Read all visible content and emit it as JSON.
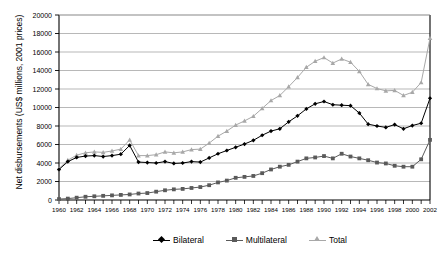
{
  "chart_data": {
    "type": "line",
    "title": "",
    "xlabel": "",
    "ylabel": "Net disbursements (US$ millions, 2001 prices)",
    "ylim": [
      0,
      20000
    ],
    "ytick_step": 2000,
    "yticks": [
      "0",
      "2000",
      "4000",
      "6000",
      "8000",
      "10000",
      "12000",
      "14000",
      "16000",
      "18000",
      "20000"
    ],
    "xlim": [
      1960,
      2002
    ],
    "xtick_step": 2,
    "grid": "horizontal",
    "legend_position": "bottom",
    "x": [
      1960,
      1961,
      1962,
      1963,
      1964,
      1965,
      1966,
      1967,
      1968,
      1969,
      1970,
      1971,
      1972,
      1973,
      1974,
      1975,
      1976,
      1977,
      1978,
      1979,
      1980,
      1981,
      1982,
      1983,
      1984,
      1985,
      1986,
      1987,
      1988,
      1989,
      1990,
      1991,
      1992,
      1993,
      1994,
      1995,
      1996,
      1997,
      1998,
      1999,
      2000,
      2001,
      2002
    ],
    "xticks": [
      "1960",
      "1962",
      "1964",
      "1966",
      "1968",
      "1970",
      "1972",
      "1974",
      "1976",
      "1978",
      "1980",
      "1982",
      "1984",
      "1986",
      "1988",
      "1990",
      "1992",
      "1994",
      "1996",
      "1998",
      "2000",
      "2002"
    ],
    "series": [
      {
        "name": "Bilateral",
        "color": "#000000",
        "marker": "diamond",
        "values": [
          3300,
          4150,
          4600,
          4750,
          4800,
          4700,
          4800,
          4950,
          5900,
          4100,
          4050,
          4000,
          4150,
          3950,
          4000,
          4150,
          4100,
          4550,
          5000,
          5350,
          5700,
          6050,
          6450,
          7000,
          7450,
          7700,
          8450,
          9100,
          9850,
          10400,
          10650,
          10300,
          10250,
          10200,
          9400,
          8200,
          8000,
          7850,
          8150,
          7700,
          8050,
          8300,
          11000
        ]
      },
      {
        "name": "Multilateral",
        "color": "#5a5a5a",
        "marker": "square",
        "values": [
          100,
          150,
          250,
          350,
          400,
          450,
          500,
          550,
          600,
          700,
          750,
          900,
          1050,
          1150,
          1200,
          1300,
          1400,
          1600,
          1900,
          2100,
          2400,
          2500,
          2600,
          2900,
          3300,
          3600,
          3800,
          4150,
          4500,
          4600,
          4750,
          4500,
          5000,
          4700,
          4500,
          4300,
          4050,
          3950,
          3700,
          3600,
          3600,
          4400,
          6500
        ]
      },
      {
        "name": "Total",
        "color": "#a8a8a8",
        "marker": "triangle",
        "values": [
          3400,
          4300,
          4850,
          5100,
          5200,
          5150,
          5300,
          5500,
          6500,
          4800,
          4800,
          4900,
          5200,
          5100,
          5200,
          5450,
          5500,
          6150,
          6900,
          7450,
          8100,
          8550,
          9050,
          9900,
          10750,
          11300,
          12250,
          13250,
          14350,
          15000,
          15400,
          14800,
          15250,
          14900,
          13900,
          12500,
          12050,
          11800,
          11850,
          11300,
          11650,
          12700,
          17500
        ]
      }
    ]
  },
  "legend": {
    "items": [
      {
        "label": "Bilateral"
      },
      {
        "label": "Multilateral"
      },
      {
        "label": "Total"
      }
    ]
  }
}
